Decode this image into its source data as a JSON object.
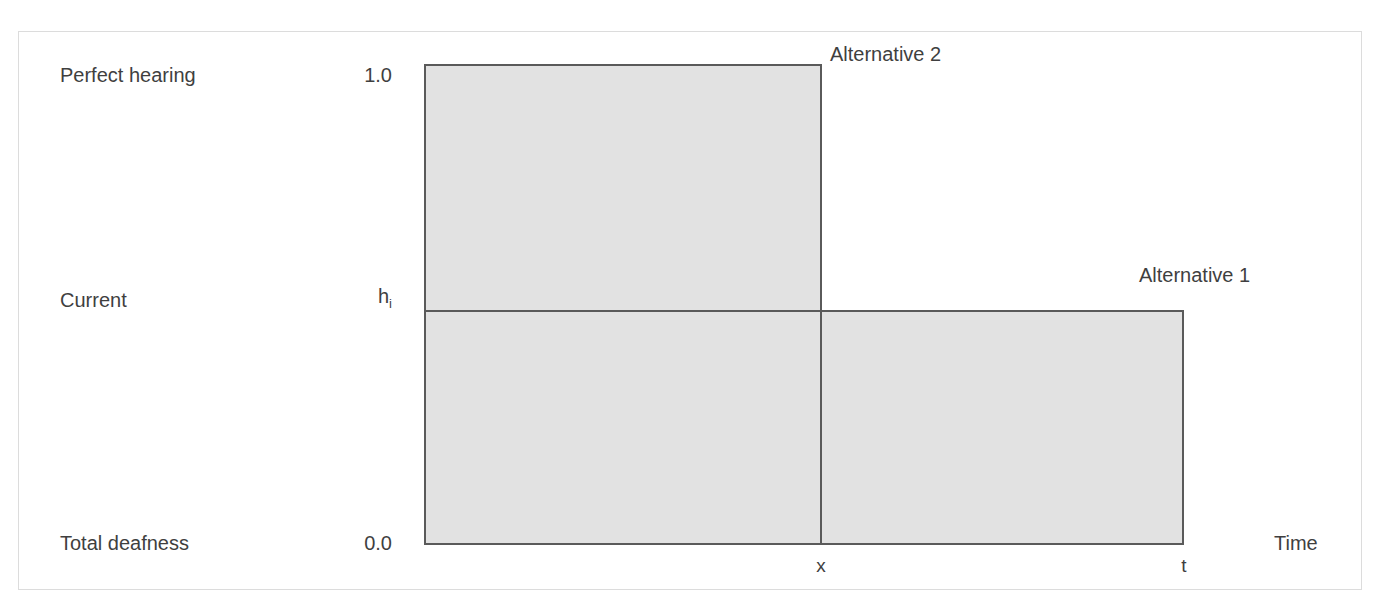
{
  "figure": {
    "frame_border_color": "#dcdcdc",
    "background_color": "#ffffff"
  },
  "axes": {
    "y_axis": {
      "ticks": [
        {
          "label": "Perfect hearing",
          "value": "1.0"
        },
        {
          "label": "Current",
          "value": "h_i"
        },
        {
          "label": "Total deafness",
          "value": "0.0"
        }
      ],
      "h_symbol": "h",
      "h_subscript": "i"
    },
    "x_axis": {
      "title": "Time",
      "ticks": [
        {
          "label": "x"
        },
        {
          "label": "t"
        }
      ]
    }
  },
  "series": [
    {
      "name": "Alternative 2",
      "label": "Alternative 2",
      "fill": "#e2e2e2",
      "stroke": "#5a5a5a"
    },
    {
      "name": "Alternative 1",
      "label": "Alternative 1",
      "fill": "#e2e2e2",
      "stroke": "#5a5a5a"
    }
  ],
  "chart_data": {
    "type": "area",
    "title": "",
    "xlabel": "Time",
    "ylabel": "",
    "xlim": [
      0,
      1
    ],
    "ylim": [
      0.0,
      1.0
    ],
    "grid": false,
    "legend_position": "inline-callout",
    "y_tick_values": [
      0.0,
      0.53,
      1.0
    ],
    "y_tick_labels": [
      "0.0",
      "h_i",
      "1.0"
    ],
    "y_tick_descriptions": [
      "Total deafness",
      "Current",
      "Perfect hearing"
    ],
    "x_tick_values": [
      0.52,
      1.0
    ],
    "x_tick_labels": [
      "x",
      "t"
    ],
    "regions": [
      {
        "name": "Alternative 2",
        "x_range": [
          0,
          0.52
        ],
        "y_range": [
          0.53,
          1.0
        ],
        "fill": "#e2e2e2",
        "stroke": "#5a5a5a",
        "label": "Alternative 2"
      },
      {
        "name": "baseline-left",
        "x_range": [
          0,
          0.52
        ],
        "y_range": [
          0.0,
          0.53
        ],
        "fill": "#e2e2e2",
        "stroke": "#5a5a5a",
        "label": ""
      },
      {
        "name": "Alternative 1",
        "x_range": [
          0.52,
          1.0
        ],
        "y_range": [
          0.0,
          0.53
        ],
        "fill": "#e2e2e2",
        "stroke": "#5a5a5a",
        "label": "Alternative 1"
      }
    ]
  }
}
